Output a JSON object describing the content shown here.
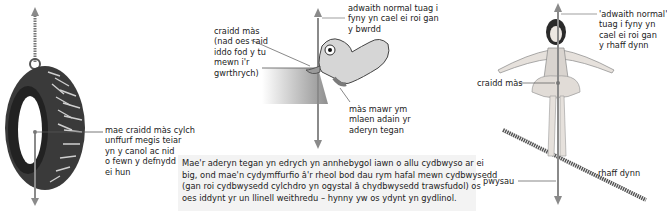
{
  "panels": {
    "tyre": {
      "label_center_of_mass": "mae craidd màs cylch\nunffurf megis teiar\nyn y canol ac nid\no fewn y defnydd\nei hun"
    },
    "bird": {
      "label_center_of_mass": "craidd màs\n(nad oes raid\niddo fod y tu\nmewn i'r\ngwrthrych)",
      "label_normal_reaction": "adwaith normal tuag i\nfyny yn cael ei roi gan\ny bwrdd",
      "label_wing_mass": "màs mawr ym\nmlaen adain yr\naderyn tegan"
    },
    "tightrope": {
      "label_normal_reaction": "'adwaith normal'\ntuag i fyny yn\ncael ei roi gan\ny rhaff dynn",
      "label_center_of_mass": "craidd màs",
      "label_rope": "rhaff dynn",
      "label_weight": "pwysau"
    }
  },
  "caption": "Mae'r aderyn tegan yn edrych yn annhebygol iawn o allu cydbwyso ar ei\nbig, ond mae'n cydymffurfio â'r rheol bod dau rym hafal mewn cydbwysedd\n(gan roi cydbwysedd cylchdro yn ogystal â chydbwysedd trawsfudol) os\noes iddynt yr un llinell weithredu – hynny yw os ydynt yn gydlinol.",
  "colors": {
    "arrow": "#8a8a8a",
    "rope": "#6a6a6a",
    "bird_body": "#d6d6d6",
    "table": "#9a9a9a",
    "caption_bg": "#f3f3f3"
  }
}
